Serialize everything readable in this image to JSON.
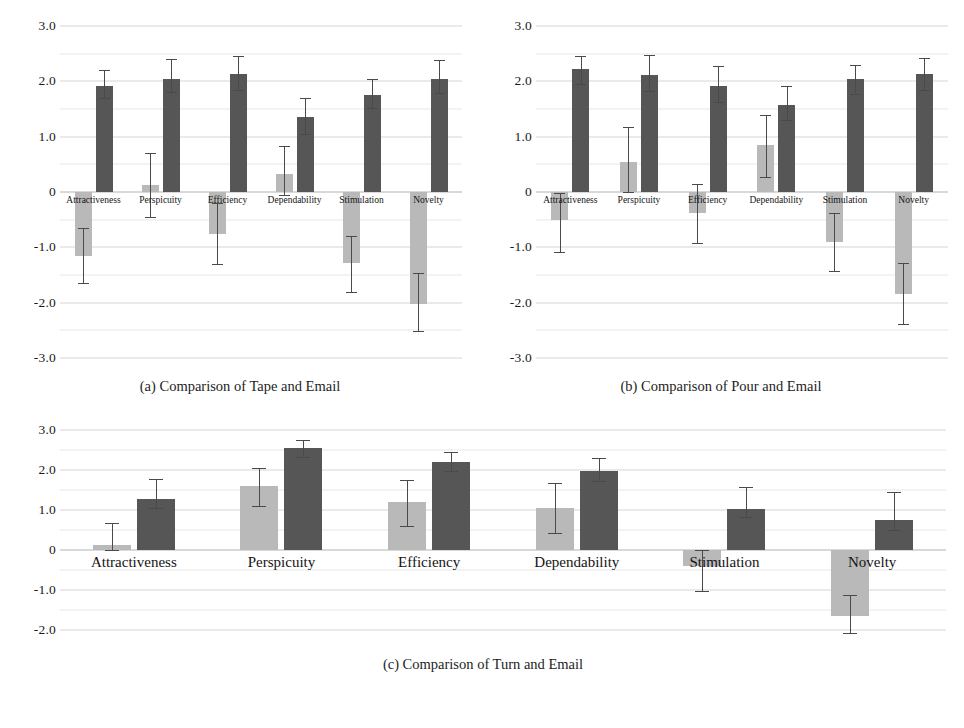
{
  "figure": {
    "panels": [
      {
        "id": "panel-a",
        "caption": "(a) Comparison of Tape and Email",
        "y_ticks": [
          "3.0",
          "2.0",
          "1.0",
          "0",
          "-1.0",
          "-2.0",
          "-3.0"
        ]
      },
      {
        "id": "panel-b",
        "caption": "(b) Comparison of Pour and Email",
        "y_ticks": [
          "3.0",
          "2.0",
          "1.0",
          "0",
          "-1.0",
          "-2.0",
          "-3.0"
        ]
      },
      {
        "id": "panel-c",
        "caption": "(c) Comparison of Turn and Email",
        "y_ticks": [
          "3.0",
          "2.0",
          "1.0",
          "0",
          "-1.0",
          "-2.0"
        ]
      }
    ],
    "colors": {
      "light_bar": "#b9b9b9",
      "dark_bar": "#565656",
      "gridline": "#d6d6d6",
      "minor_gridline": "#e8e8e8",
      "zero_line": "#b4b4b4",
      "error_bar": "#4a4a4a",
      "background": "#ffffff",
      "text": "#141414"
    }
  },
  "chart_data": [
    {
      "type": "bar",
      "title": "(a) Comparison of Tape and Email",
      "xlabel": "",
      "ylabel": "",
      "ylim": [
        -3.0,
        3.0
      ],
      "ytick_step": 1.0,
      "minor_tick_step": 0.5,
      "grid": true,
      "legend": [],
      "orientation": "vertical",
      "error_bars": "std-dev",
      "categories": [
        "Attractiveness",
        "Perspicuity",
        "Efficiency",
        "Dependability",
        "Stimulation",
        "Novelty"
      ],
      "series": [
        {
          "name": "Tape",
          "color": "#b9b9b9",
          "values": [
            -1.15,
            0.12,
            -0.75,
            0.33,
            -1.28,
            -2.02
          ],
          "err_low": [
            -1.65,
            -0.45,
            -1.3,
            -0.05,
            -1.8,
            -2.52
          ],
          "err_high": [
            -0.65,
            0.7,
            -0.2,
            0.84,
            -0.8,
            -1.46
          ]
        },
        {
          "name": "Email",
          "color": "#565656",
          "values": [
            1.92,
            2.05,
            2.13,
            1.35,
            1.75,
            2.04
          ],
          "err_low": [
            1.69,
            1.8,
            1.85,
            1.04,
            1.52,
            1.79
          ],
          "err_high": [
            2.2,
            2.4,
            2.45,
            1.7,
            2.05,
            2.38
          ]
        }
      ]
    },
    {
      "type": "bar",
      "title": "(b) Comparison of Pour and Email",
      "xlabel": "",
      "ylabel": "",
      "ylim": [
        -3.0,
        3.0
      ],
      "ytick_step": 1.0,
      "minor_tick_step": 0.5,
      "grid": true,
      "legend": [],
      "orientation": "vertical",
      "error_bars": "std-dev",
      "categories": [
        "Attractiveness",
        "Perspicuity",
        "Efficiency",
        "Dependability",
        "Stimulation",
        "Novelty"
      ],
      "series": [
        {
          "name": "Pour",
          "color": "#b9b9b9",
          "values": [
            -0.5,
            0.55,
            -0.38,
            0.85,
            -0.9,
            -1.85
          ],
          "err_low": [
            -1.08,
            0.0,
            -0.92,
            0.28,
            -1.42,
            -2.38
          ],
          "err_high": [
            -0.02,
            1.18,
            0.15,
            1.4,
            -0.38,
            -1.28
          ]
        },
        {
          "name": "Email",
          "color": "#565656",
          "values": [
            2.22,
            2.12,
            1.92,
            1.58,
            2.05,
            2.14
          ],
          "err_low": [
            1.95,
            1.82,
            1.62,
            1.3,
            1.78,
            1.85
          ],
          "err_high": [
            2.45,
            2.48,
            2.28,
            1.92,
            2.3,
            2.42
          ]
        }
      ]
    },
    {
      "type": "bar",
      "title": "(c) Comparison of Turn and Email",
      "xlabel": "",
      "ylabel": "",
      "ylim": [
        -2.3,
        3.0
      ],
      "ytick_step": 1.0,
      "minor_tick_step": 0.5,
      "grid": true,
      "legend": [],
      "orientation": "vertical",
      "error_bars": "std-dev",
      "categories": [
        "Attractiveness",
        "Perspicuity",
        "Efficiency",
        "Dependability",
        "Stimulation",
        "Novelty"
      ],
      "series": [
        {
          "name": "Turn",
          "color": "#b9b9b9",
          "values": [
            0.13,
            1.6,
            1.2,
            1.05,
            -0.4,
            -1.65
          ],
          "err_low": [
            0.0,
            1.1,
            0.6,
            0.42,
            -1.02,
            -2.08
          ],
          "err_high": [
            0.68,
            2.05,
            1.75,
            1.68,
            0.0,
            -1.12
          ]
        },
        {
          "name": "Email",
          "color": "#565656",
          "values": [
            1.27,
            2.55,
            2.2,
            1.97,
            1.03,
            0.75
          ],
          "err_low": [
            1.05,
            2.32,
            1.98,
            1.72,
            0.82,
            0.5
          ],
          "err_high": [
            1.78,
            2.75,
            2.45,
            2.3,
            1.58,
            1.45
          ]
        }
      ]
    }
  ]
}
